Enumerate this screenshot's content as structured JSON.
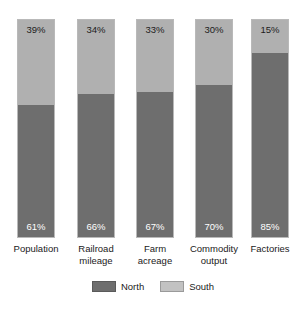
{
  "chart_data": {
    "type": "bar",
    "subtype": "stacked-100-percent",
    "title": "",
    "subtitle": "",
    "xlabel": "",
    "ylabel": "",
    "ylim": [
      0,
      100
    ],
    "grid": false,
    "legend_position": "bottom-center",
    "categories": [
      "Population",
      "Railroad mileage",
      "Farm acreage",
      "Commodity output",
      "Factories"
    ],
    "series": [
      {
        "name": "North",
        "color": "#6e6e6e",
        "values": [
          61,
          66,
          67,
          70,
          85
        ]
      },
      {
        "name": "South",
        "color": "#b0b0b0",
        "values": [
          39,
          34,
          33,
          30,
          15
        ]
      }
    ],
    "bars": [
      {
        "category": "Population",
        "category_line1": "Population",
        "category_line2": "",
        "south_value": 39,
        "south_label": "39%",
        "north_value": 61,
        "north_label": "61%"
      },
      {
        "category": "Railroad mileage",
        "category_line1": "Railroad",
        "category_line2": "mileage",
        "south_value": 34,
        "south_label": "34%",
        "north_value": 66,
        "north_label": "66%"
      },
      {
        "category": "Farm acreage",
        "category_line1": "Farm",
        "category_line2": "acreage",
        "south_value": 33,
        "south_label": "33%",
        "north_value": 67,
        "north_label": "67%"
      },
      {
        "category": "Commodity output",
        "category_line1": "Commodity",
        "category_line2": "output",
        "south_value": 30,
        "south_label": "30%",
        "north_value": 70,
        "north_label": "70%"
      },
      {
        "category": "Factories",
        "category_line1": "Factories",
        "category_line2": "",
        "south_value": 15,
        "south_label": "15%",
        "north_value": 85,
        "north_label": "85%"
      }
    ]
  },
  "legend": {
    "items": [
      {
        "label": "North",
        "color": "#6e6e6e"
      },
      {
        "label": "South",
        "color": "#b0b0b0"
      }
    ]
  }
}
